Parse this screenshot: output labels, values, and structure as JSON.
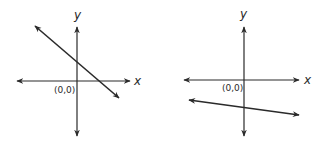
{
  "graphs": [
    {
      "name": "left-graph",
      "x_label": "x",
      "y_label": "y",
      "origin_label": "(0,0)",
      "line_description": "line with negative slope, positive y-intercept",
      "line_slope_sign": "negative",
      "y_intercept_sign": "positive"
    },
    {
      "name": "right-graph",
      "x_label": "x",
      "y_label": "y",
      "origin_label": "(0,0)",
      "line_description": "line with slight negative slope, negative y-intercept",
      "line_slope_sign": "negative",
      "y_intercept_sign": "negative"
    }
  ],
  "colors": {
    "ink": "#2a2a2a",
    "background": "#ffffff"
  }
}
